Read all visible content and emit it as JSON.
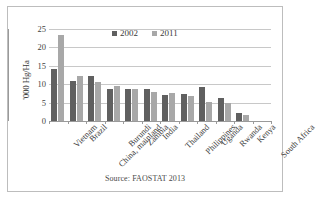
{
  "chart_data": {
    "type": "bar",
    "title": "",
    "xlabel": "",
    "ylabel": "'000 Hg/Ha",
    "ylim": [
      0,
      25
    ],
    "ytick_labels": [
      "25",
      "20",
      "15",
      "10",
      "5",
      "0"
    ],
    "ytick_values": [
      25,
      20,
      15,
      10,
      5,
      0
    ],
    "grid": true,
    "legend_position": "top-center",
    "categories": [
      "Vietnam",
      "Brazil",
      "China, mainland",
      "Burundi",
      "Zambia",
      "India",
      "Thailand",
      "Philippines",
      "Uganda",
      "Rwanda",
      "Kenya",
      "South Africa"
    ],
    "series": [
      {
        "name": "2002",
        "color": "#606060",
        "values": [
          14.1,
          10.9,
          12.2,
          8.6,
          8.8,
          8.8,
          7.2,
          7.4,
          9.2,
          6.2,
          2.3,
          0
        ]
      },
      {
        "name": "2011",
        "color": "#a8a8a8",
        "values": [
          23.3,
          12.3,
          10.6,
          9.6,
          8.8,
          7.9,
          7.5,
          6.8,
          5.3,
          5.0,
          1.6,
          0
        ]
      }
    ],
    "source_note": "Source: FAOSTAT 2013"
  },
  "legend": {
    "items": [
      {
        "label": "2002",
        "color": "#606060"
      },
      {
        "label": "2011",
        "color": "#a8a8a8"
      }
    ]
  },
  "axis": {
    "y_title": "'000 Hg/Ha"
  },
  "footer": {
    "source": "Source: FAOSTAT 2013"
  }
}
